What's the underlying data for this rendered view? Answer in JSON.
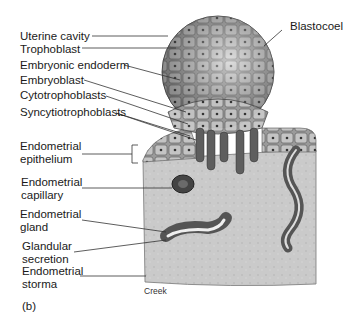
{
  "figure": {
    "panel_label": "(b)",
    "credit": "Creek",
    "labels_left": [
      {
        "id": "uterine-cavity",
        "text": "Uterine cavity"
      },
      {
        "id": "trophoblast",
        "text": "Trophoblast"
      },
      {
        "id": "embryonic-endoderm",
        "text": "Embryonic endoderm"
      },
      {
        "id": "embryoblast",
        "text": "Embryoblast"
      },
      {
        "id": "cytotrophoblasts",
        "text": "Cytotrophoblasts"
      },
      {
        "id": "syncytiotrophoblasts",
        "text": "Syncytiotrophoblasts"
      },
      {
        "id": "endometrial-epithelium",
        "line1": "Endometrial",
        "line2": "epithelium"
      },
      {
        "id": "endometrial-capillary",
        "line1": "Endometrial",
        "line2": "capillary"
      },
      {
        "id": "endometrial-gland",
        "line1": "Endometrial",
        "line2": "gland"
      },
      {
        "id": "glandular-secretion",
        "line1": "Glandular",
        "line2": "secretion"
      },
      {
        "id": "endometrial-storma",
        "line1": "Endometrial",
        "line2": "storma"
      }
    ],
    "labels_right": [
      {
        "id": "blastocoel",
        "text": "Blastocoel"
      }
    ],
    "colors": {
      "stroma": "#c9c9c9",
      "cells_dark": "#5a5a5a",
      "cells_light": "#b8b8b8",
      "line": "#333333"
    }
  }
}
